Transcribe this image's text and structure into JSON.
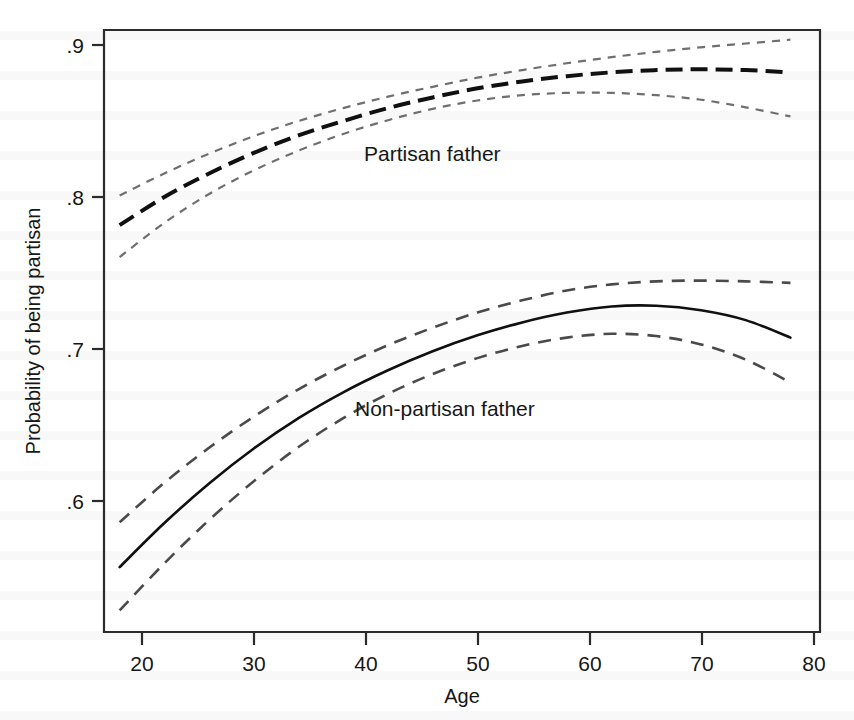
{
  "figure": {
    "background_color": "#ffffff",
    "frame_color": "#2b2b2b"
  },
  "chart_data": {
    "type": "line",
    "title": "",
    "subtitle": "",
    "xlabel": "Age",
    "ylabel": "Probability of being partisan",
    "xlim": [
      17.0,
      80.8
    ],
    "ylim": [
      0.522,
      0.908
    ],
    "xticks": [
      20,
      30,
      40,
      50,
      60,
      70,
      80
    ],
    "xticklabels": [
      "20",
      "30",
      "40",
      "50",
      "60",
      "70",
      "80"
    ],
    "yticks": [
      0.6,
      0.7,
      0.8,
      0.9
    ],
    "yticklabels": [
      ".6",
      ".7",
      ".8",
      ".9"
    ],
    "grid": false,
    "legend": "inline-annotations",
    "annotations": [
      {
        "text": "Partisan father",
        "x": 42,
        "y": 0.845
      },
      {
        "text": "Non-partisan father",
        "x": 41,
        "y": 0.662
      }
    ],
    "x": [
      18,
      22,
      26,
      30,
      34,
      38,
      42,
      46,
      50,
      54,
      58,
      62,
      66,
      70,
      74,
      78
    ],
    "series": [
      {
        "name": "Partisan father",
        "role": "fitted",
        "style": "long-dashed",
        "color": "#101010",
        "values": [
          0.7815,
          0.8,
          0.8155,
          0.829,
          0.8405,
          0.85,
          0.8585,
          0.8655,
          0.8715,
          0.876,
          0.8795,
          0.882,
          0.8835,
          0.884,
          0.8835,
          0.882
        ]
      },
      {
        "name": "Partisan father upper 95% CI",
        "role": "ci-upper",
        "style": "fine-dashed",
        "color": "#6f6f6f",
        "values": [
          0.801,
          0.8155,
          0.8285,
          0.84,
          0.85,
          0.8585,
          0.866,
          0.8725,
          0.8785,
          0.8835,
          0.888,
          0.892,
          0.8955,
          0.8985,
          0.901,
          0.9035
        ]
      },
      {
        "name": "Partisan father lower 95% CI",
        "role": "ci-lower",
        "style": "fine-dashed",
        "color": "#6f6f6f",
        "values": [
          0.7605,
          0.783,
          0.802,
          0.8175,
          0.8305,
          0.8415,
          0.8505,
          0.858,
          0.8635,
          0.867,
          0.8685,
          0.8685,
          0.867,
          0.864,
          0.859,
          0.853
        ]
      },
      {
        "name": "Non-partisan father",
        "role": "fitted",
        "style": "solid",
        "color": "#101010",
        "values": [
          0.5565,
          0.5855,
          0.6115,
          0.6345,
          0.6545,
          0.6715,
          0.686,
          0.6985,
          0.709,
          0.7175,
          0.724,
          0.728,
          0.7285,
          0.7255,
          0.719,
          0.7075
        ]
      },
      {
        "name": "Non-partisan father upper 95% CI",
        "role": "ci-upper",
        "style": "coarse-dashed",
        "color": "#4a4a4a",
        "values": [
          0.586,
          0.612,
          0.635,
          0.6555,
          0.6735,
          0.689,
          0.7025,
          0.714,
          0.724,
          0.732,
          0.7385,
          0.7425,
          0.7445,
          0.745,
          0.7445,
          0.7435
        ]
      },
      {
        "name": "Non-partisan father lower 95% CI",
        "role": "ci-lower",
        "style": "coarse-dashed",
        "color": "#4a4a4a",
        "values": [
          0.528,
          0.559,
          0.5875,
          0.613,
          0.6355,
          0.6545,
          0.6705,
          0.6835,
          0.694,
          0.702,
          0.7075,
          0.71,
          0.7085,
          0.703,
          0.693,
          0.678
        ]
      }
    ]
  }
}
